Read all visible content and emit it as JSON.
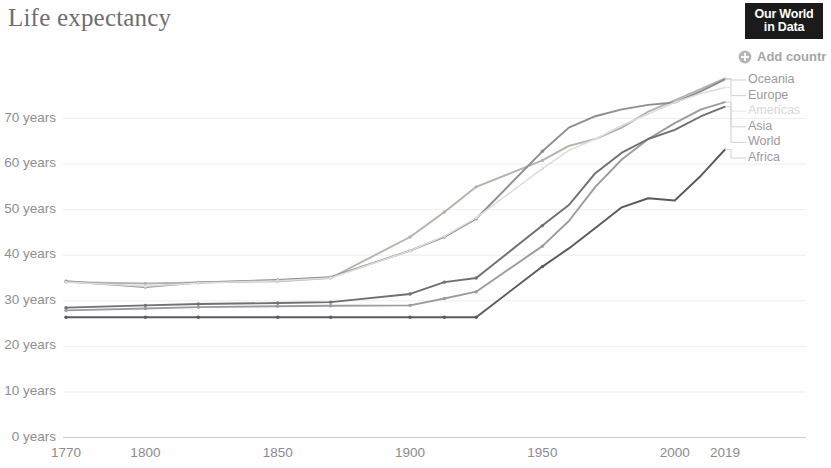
{
  "header": {
    "title": "Life expectancy",
    "logo_line1": "Our World",
    "logo_line2": "in Data",
    "add_country_label": "Add countr",
    "add_country_icon": "plus-circle-icon"
  },
  "legend": {
    "items": [
      {
        "label": "Oceania",
        "color": "#b9b2a8",
        "faded": false
      },
      {
        "label": "Europe",
        "color": "#8d8d92",
        "faded": false
      },
      {
        "label": "Americas",
        "color": "#dedee0",
        "faded": true
      },
      {
        "label": "Asia",
        "color": "#9b9ba0",
        "faded": false
      },
      {
        "label": "World",
        "color": "#6f6f74",
        "faded": false
      },
      {
        "label": "Africa",
        "color": "#595960",
        "faded": false
      }
    ]
  },
  "axes": {
    "y_ticks": [
      "0 years",
      "10 years",
      "20 years",
      "30 years",
      "40 years",
      "50 years",
      "60 years",
      "70 years"
    ],
    "y_values": [
      0,
      10,
      20,
      30,
      40,
      50,
      60,
      70
    ],
    "x_ticks": [
      "1770",
      "1800",
      "1850",
      "1900",
      "1950",
      "2000",
      "2019"
    ],
    "x_values": [
      1770,
      1800,
      1850,
      1900,
      1950,
      2000,
      2019
    ]
  },
  "chart_data": {
    "type": "line",
    "title": "Life expectancy",
    "xlabel": "",
    "ylabel": "years",
    "xlim": [
      1770,
      2019
    ],
    "ylim": [
      0,
      76
    ],
    "grid": true,
    "legend_position": "right",
    "unit": "years",
    "x": [
      1770,
      1800,
      1820,
      1850,
      1870,
      1900,
      1913,
      1925,
      1950,
      1960,
      1970,
      1980,
      1990,
      2000,
      2010,
      2019
    ],
    "series": [
      {
        "name": "Oceania",
        "color": "#b9b2a8",
        "values": [
          34.1,
          33.8,
          34.0,
          34.3,
          35.0,
          44.0,
          49.5,
          55.0,
          60.8,
          64.0,
          65.5,
          68.0,
          71.5,
          74.0,
          76.5,
          78.8
        ]
      },
      {
        "name": "Europe",
        "color": "#8d8d92",
        "values": [
          34.3,
          33.0,
          34.0,
          34.6,
          35.2,
          41.0,
          44.0,
          48.0,
          62.8,
          68.0,
          70.5,
          72.0,
          73.0,
          73.5,
          76.0,
          78.6
        ]
      },
      {
        "name": "Americas",
        "color": "#dedee0",
        "values": [
          34.1,
          33.2,
          33.9,
          34.4,
          35.0,
          41.0,
          44.2,
          48.2,
          59.0,
          63.0,
          65.5,
          68.5,
          71.0,
          73.5,
          75.5,
          76.8
        ]
      },
      {
        "name": "Asia",
        "color": "#9b9ba0",
        "values": [
          27.9,
          28.3,
          28.6,
          28.8,
          28.9,
          29.0,
          30.5,
          32.0,
          42.0,
          47.5,
          55.0,
          61.0,
          65.5,
          69.0,
          72.0,
          73.6
        ]
      },
      {
        "name": "World",
        "color": "#6f6f74",
        "values": [
          28.5,
          29.0,
          29.3,
          29.5,
          29.7,
          31.5,
          34.1,
          35.0,
          46.5,
          51.0,
          58.0,
          62.5,
          65.5,
          67.5,
          70.5,
          72.6
        ]
      },
      {
        "name": "Africa",
        "color": "#595960",
        "values": [
          26.4,
          26.4,
          26.4,
          26.4,
          26.4,
          26.4,
          26.4,
          26.4,
          37.5,
          41.5,
          46.0,
          50.5,
          52.5,
          52.0,
          57.5,
          63.2
        ]
      }
    ]
  }
}
